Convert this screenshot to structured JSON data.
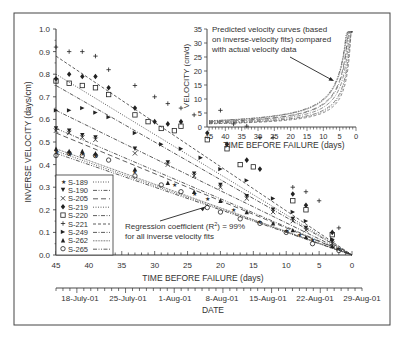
{
  "chart_data": [
    {
      "id": "main",
      "type": "scatter",
      "title": "",
      "xlabel": "TIME BEFORE FAILURE (days)",
      "ylabel": "INVERSE VELOCITY (days/cm)",
      "xlim": [
        45,
        0
      ],
      "ylim": [
        0.0,
        1.0
      ],
      "x_ticks": [
        45,
        40,
        35,
        30,
        25,
        20,
        15,
        10,
        5,
        0
      ],
      "y_ticks": [
        "0.0",
        "0.1",
        "0.2",
        "0.3",
        "0.4",
        "0.5",
        "0.6",
        "0.7",
        "0.8",
        "0.9",
        "1.0"
      ],
      "secondary_xaxis": {
        "label": "DATE",
        "ticks": [
          "18-July-01",
          "25-July-01",
          "1-Aug-01",
          "8-Aug-01",
          "15-Aug-01",
          "22-Aug-01",
          "29-Aug-01"
        ]
      },
      "legend_position": "lower-left",
      "series": [
        {
          "name": "S-189",
          "marker": "star",
          "line": "dotted",
          "fit_intercept_at_45": 0.46,
          "points": [
            [
              45,
              0.46
            ],
            [
              43,
              0.45
            ],
            [
              41,
              0.45
            ],
            [
              39,
              0.44
            ],
            [
              33,
              0.37
            ],
            [
              27,
              0.31
            ],
            [
              24,
              0.27
            ],
            [
              22,
              0.25
            ],
            [
              18,
              0.2
            ],
            [
              14,
              0.15
            ],
            [
              10,
              0.11
            ],
            [
              8,
              0.09
            ],
            [
              6,
              0.07
            ],
            [
              2,
              0.03
            ]
          ]
        },
        {
          "name": "S-190",
          "marker": "triangle-down",
          "line": "dash-dot-dot",
          "fit_intercept_at_45": 0.56,
          "points": [
            [
              45,
              0.56
            ],
            [
              43,
              0.55
            ],
            [
              41,
              0.53
            ],
            [
              39,
              0.52
            ],
            [
              33,
              0.47
            ],
            [
              28,
              0.41
            ],
            [
              24,
              0.36
            ],
            [
              20,
              0.31
            ],
            [
              16,
              0.26
            ],
            [
              12,
              0.2
            ],
            [
              9,
              0.16
            ],
            [
              7,
              0.12
            ],
            [
              3,
              0.06
            ]
          ]
        },
        {
          "name": "S-205",
          "marker": "x",
          "line": "long-dash",
          "fit_intercept_at_45": 0.54,
          "points": [
            [
              45,
              0.55
            ],
            [
              43,
              0.54
            ],
            [
              41,
              0.52
            ],
            [
              39,
              0.51
            ],
            [
              33,
              0.45
            ],
            [
              28,
              0.4
            ],
            [
              24,
              0.35
            ],
            [
              20,
              0.3
            ],
            [
              16,
              0.25
            ],
            [
              12,
              0.19
            ],
            [
              9,
              0.15
            ],
            [
              7,
              0.11
            ],
            [
              3,
              0.05
            ]
          ]
        },
        {
          "name": "S-219",
          "marker": "diamond-filled",
          "line": "dotted",
          "fit_intercept_at_45": 0.8,
          "points": [
            [
              45,
              0.78
            ],
            [
              43,
              0.8
            ],
            [
              41,
              0.79
            ],
            [
              39,
              0.79
            ],
            [
              37,
              0.74
            ],
            [
              33,
              0.65
            ],
            [
              30,
              0.59
            ],
            [
              28,
              0.58
            ],
            [
              26,
              0.59
            ],
            [
              22,
              0.54
            ],
            [
              19,
              0.49
            ],
            [
              16,
              0.42
            ],
            [
              14,
              0.38
            ],
            [
              9,
              0.27
            ],
            [
              7,
              0.22
            ],
            [
              3,
              0.1
            ]
          ]
        },
        {
          "name": "S-220",
          "marker": "square-open",
          "line": "dash-dot",
          "fit_intercept_at_45": 0.75,
          "points": [
            [
              45,
              0.77
            ],
            [
              43,
              0.76
            ],
            [
              41,
              0.75
            ],
            [
              39,
              0.74
            ],
            [
              37,
              0.71
            ],
            [
              33,
              0.62
            ],
            [
              31,
              0.59
            ],
            [
              29,
              0.56
            ],
            [
              27,
              0.55
            ],
            [
              26,
              0.57
            ],
            [
              22,
              0.51
            ],
            [
              19,
              0.47
            ],
            [
              17,
              0.4
            ],
            [
              15,
              0.39
            ],
            [
              9,
              0.24
            ],
            [
              7,
              0.2
            ],
            [
              3,
              0.09
            ]
          ]
        },
        {
          "name": "S-221",
          "marker": "plus",
          "line": "dashed",
          "fit_intercept_at_45": 0.88,
          "points": [
            [
              45,
              0.92
            ],
            [
              43,
              0.9
            ],
            [
              41,
              0.9
            ],
            [
              39,
              0.88
            ],
            [
              37,
              0.82
            ],
            [
              33,
              0.75
            ],
            [
              30,
              0.7
            ],
            [
              28,
              0.67
            ],
            [
              26,
              0.65
            ],
            [
              24,
              0.62
            ],
            [
              20,
              0.64
            ],
            [
              18,
              0.58
            ],
            [
              16,
              0.57
            ],
            [
              14,
              0.52
            ],
            [
              12,
              0.52
            ],
            [
              9,
              0.3
            ],
            [
              7,
              0.28
            ],
            [
              5,
              0.24
            ],
            [
              2,
              0.12
            ]
          ]
        },
        {
          "name": "S-249",
          "marker": "triangle-right",
          "line": "dash-dot",
          "fit_intercept_at_45": 0.64,
          "points": [
            [
              45,
              0.64
            ],
            [
              43,
              0.64
            ],
            [
              41,
              0.65
            ],
            [
              39,
              0.63
            ],
            [
              37,
              0.61
            ],
            [
              33,
              0.54
            ],
            [
              29,
              0.49
            ],
            [
              26,
              0.47
            ],
            [
              23,
              0.43
            ],
            [
              20,
              0.38
            ],
            [
              16,
              0.33
            ],
            [
              12,
              0.25
            ],
            [
              9,
              0.19
            ],
            [
              7,
              0.15
            ],
            [
              3,
              0.07
            ]
          ]
        },
        {
          "name": "S-262",
          "marker": "triangle-up",
          "line": "fine-dotted",
          "fit_intercept_at_45": 0.47,
          "points": [
            [
              45,
              0.47
            ],
            [
              43,
              0.46
            ],
            [
              41,
              0.46
            ],
            [
              39,
              0.45
            ],
            [
              33,
              0.38
            ],
            [
              28,
              0.32
            ],
            [
              24,
              0.28
            ],
            [
              20,
              0.24
            ],
            [
              16,
              0.19
            ],
            [
              12,
              0.14
            ],
            [
              9,
              0.11
            ],
            [
              7,
              0.08
            ],
            [
              3,
              0.04
            ]
          ]
        },
        {
          "name": "S-265",
          "marker": "circle-open",
          "line": "dash-dot-dot",
          "fit_intercept_at_45": 0.45,
          "points": [
            [
              45,
              0.44
            ],
            [
              43,
              0.45
            ],
            [
              41,
              0.44
            ],
            [
              39,
              0.44
            ],
            [
              37,
              0.42
            ],
            [
              33,
              0.35
            ],
            [
              29,
              0.31
            ],
            [
              26,
              0.28
            ],
            [
              22,
              0.21
            ],
            [
              20,
              0.19
            ],
            [
              17,
              0.16
            ],
            [
              14,
              0.14
            ],
            [
              10,
              0.1
            ],
            [
              6,
              0.05
            ],
            [
              2,
              0.02
            ]
          ]
        }
      ],
      "annotations": [
        {
          "text_line1": "Regression coefficient (R",
          "sup": "2",
          "text_line1_end": ") = 99%",
          "text_line2": "for all inverse velocity fits",
          "arrow_to": [
            22,
            0.23
          ]
        }
      ]
    },
    {
      "id": "inset",
      "type": "line",
      "title": "",
      "xlabel": "TIME BEFORE FAILURE (days)",
      "ylabel": "VELOCITY (cm/d)",
      "xlim": [
        45,
        0
      ],
      "ylim": [
        0,
        35
      ],
      "x_ticks": [
        45,
        40,
        35,
        30,
        25,
        20,
        15,
        10,
        5,
        0
      ],
      "y_ticks": [
        0,
        5,
        10,
        15,
        20,
        25,
        30,
        35
      ],
      "description": "Nine predicted velocity curves V = 1/(a*t) rising hyperbolically from ~1-2 cm/d at 45 days to ~30-34 cm/d near 1 day before failure",
      "annotations": [
        {
          "lines": [
            "Predicted velocity curves (based",
            "on inverse-velocity fits) compared",
            "with actual velocity data"
          ],
          "arrow_to": [
            5,
            15
          ]
        }
      ]
    }
  ],
  "ui": {
    "main_xlabel": "TIME BEFORE FAILURE (days)",
    "main_ylabel": "INVERSE VELOCITY (days/cm)",
    "date_label": "DATE",
    "inset_xlabel": "TIME BEFORE FAILURE (days)",
    "inset_ylabel": "VELOCITY (cm/d)",
    "r2_line1a": "Regression coefficient (R",
    "r2_sup": "2",
    "r2_line1b": ") = 99%",
    "r2_line2": "for all inverse velocity fits",
    "inset_note": [
      "Predicted velocity curves (based",
      "on inverse-velocity fits) compared",
      "with actual velocity data"
    ]
  }
}
